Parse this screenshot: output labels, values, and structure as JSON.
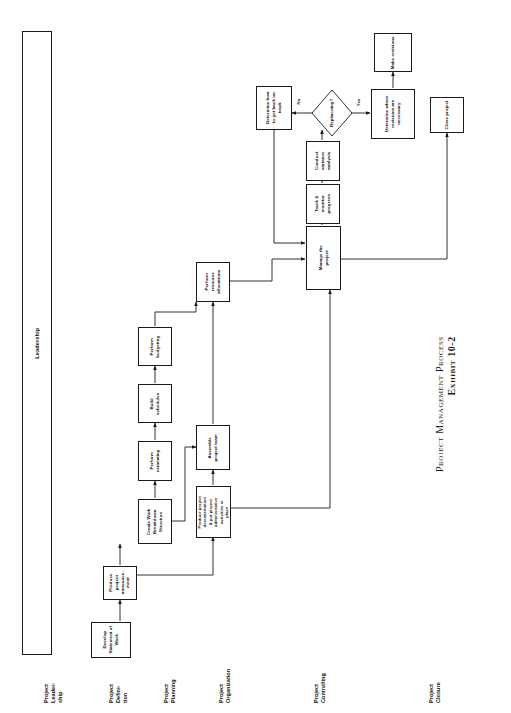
{
  "caption": {
    "line1": "Project Management Process",
    "line2": "Exhibit 10-2"
  },
  "swimlane": {
    "leadership_label": "Leadership"
  },
  "row_labels": [
    {
      "id": "project-leadership",
      "text": "Project\nLeader-\nship"
    },
    {
      "id": "project-definition",
      "text": "Project\nDefini-\ntion"
    },
    {
      "id": "project-planning",
      "text": "Project\nPlanning"
    },
    {
      "id": "project-organization",
      "text": "Project\nOrganization"
    },
    {
      "id": "project-controlling",
      "text": "Project\nControlling"
    },
    {
      "id": "project-closure",
      "text": "Project\nClosure"
    }
  ],
  "nodes": {
    "develop_sow": "Develop Statement of Work",
    "produce_announcement": "Produce project announce-ment",
    "create_wbs": "Create Work Breakdown Structure",
    "perform_estimating": "Perform estimating",
    "build_schedules": "Build schedules",
    "perform_budgeting": "Perform budgeting",
    "perform_resource_allocations": "Perform resource allocations",
    "assemble_team": "Assemble project team",
    "produce_documentation": "Produce project documentation & put project administrative activities in place",
    "manage_project": "Manage the project",
    "track_monitor": "Track & monitor progress",
    "conduct_variance": "Conduct variance analysis",
    "replanning_decision": "Replan-ning?",
    "determine_back_on_track": "Determine how to get back on track",
    "determine_revisions": "Determine where revisions are necessary",
    "make_revisions": "Make revisions",
    "close_project": "Close project"
  },
  "edge_labels": {
    "no": "No",
    "yes": "Yes"
  },
  "colors": {
    "stroke": "#1a1a1a",
    "background": "#ffffff",
    "text": "#111111"
  }
}
